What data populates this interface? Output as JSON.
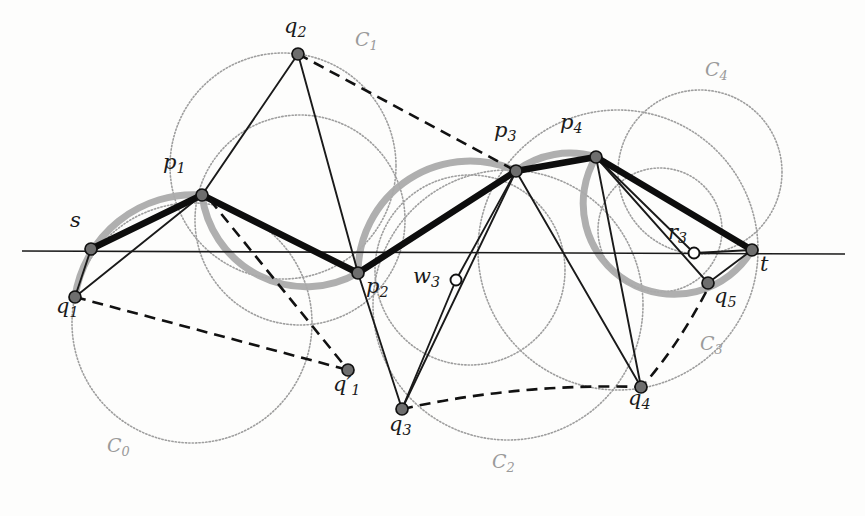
{
  "figure": {
    "background_color": "#fdfdfc",
    "ink_color": "#1a1a1a",
    "circle_color": "#9a9a9a",
    "highlight_color": "#a8a8a8",
    "width": 865,
    "height": 516
  },
  "labels": {
    "s": "s",
    "t": "t",
    "p1": "p",
    "p1_sub": "1",
    "p2": "p",
    "p2_sub": "2",
    "p3": "p",
    "p3_sub": "3",
    "p4": "p",
    "p4_sub": "4",
    "q1": "q",
    "q1_sub": "1",
    "q1p": "q",
    "q1p_sub": "1",
    "q1p_prime": "′",
    "q2": "q",
    "q2_sub": "2",
    "q3": "q",
    "q3_sub": "3",
    "q4": "q",
    "q4_sub": "4",
    "q5": "q",
    "q5_sub": "5",
    "w3": "w",
    "w3_sub": "3",
    "r3": "r",
    "r3_sub": "3",
    "C0": "C",
    "C0_sub": "0",
    "C1": "C",
    "C1_sub": "1",
    "C2": "C",
    "C2_sub": "2",
    "C3": "C",
    "C3_sub": "3",
    "C4": "C",
    "C4_sub": "4"
  },
  "label_positions": {
    "s": {
      "x": 70,
      "y": 222
    },
    "t": {
      "x": 760,
      "y": 252
    },
    "p1": {
      "x": 163,
      "y": 162
    },
    "p2": {
      "x": 366,
      "y": 278
    },
    "p3": {
      "x": 496,
      "y": 130
    },
    "p4": {
      "x": 560,
      "y": 122
    },
    "q1": {
      "x": 56,
      "y": 303
    },
    "q1p": {
      "x": 333,
      "y": 381
    },
    "q2": {
      "x": 284,
      "y": 20
    },
    "q3": {
      "x": 389,
      "y": 418
    },
    "q4": {
      "x": 628,
      "y": 392
    },
    "q5": {
      "x": 714,
      "y": 290
    },
    "w3": {
      "x": 415,
      "y": 265
    },
    "r3": {
      "x": 669,
      "y": 219
    },
    "C0": {
      "x": 107,
      "y": 440
    },
    "C1": {
      "x": 355,
      "y": 32
    },
    "C2": {
      "x": 492,
      "y": 456
    },
    "C3": {
      "x": 700,
      "y": 338
    },
    "C4": {
      "x": 705,
      "y": 64
    }
  },
  "geometry": {
    "baseline": {
      "x1": 22,
      "y1": 251,
      "x2": 845,
      "y2": 254
    },
    "points": {
      "s": {
        "x": 91,
        "y": 249,
        "style": "filled"
      },
      "t": {
        "x": 752,
        "y": 250,
        "style": "filled"
      },
      "p1": {
        "x": 202,
        "y": 195,
        "style": "filled"
      },
      "p2": {
        "x": 358,
        "y": 273,
        "style": "filled"
      },
      "p3": {
        "x": 516,
        "y": 171,
        "style": "filled"
      },
      "p4": {
        "x": 596,
        "y": 157,
        "style": "filled"
      },
      "q1": {
        "x": 75,
        "y": 297,
        "style": "filled"
      },
      "q1p": {
        "x": 348,
        "y": 370,
        "style": "filled"
      },
      "q2": {
        "x": 298,
        "y": 54,
        "style": "filled"
      },
      "q3": {
        "x": 402,
        "y": 409,
        "style": "filled"
      },
      "q4": {
        "x": 641,
        "y": 387,
        "style": "filled"
      },
      "q5": {
        "x": 708,
        "y": 283,
        "style": "filled"
      },
      "w3": {
        "x": 456,
        "y": 280,
        "style": "hollow"
      },
      "r3": {
        "x": 694,
        "y": 253,
        "style": "hollow"
      }
    },
    "circles": [
      {
        "name": "C0",
        "cx": 192,
        "cy": 323,
        "r": 120
      },
      {
        "name": "C1",
        "cx": 283,
        "cy": 166,
        "r": 113
      },
      {
        "name": "C2",
        "cx": 508,
        "cy": 305,
        "r": 135
      },
      {
        "name": "C3",
        "cx": 618,
        "cy": 250,
        "r": 140
      },
      {
        "name": "C4",
        "cx": 700,
        "cy": 172,
        "r": 82
      },
      {
        "name": "extra-left",
        "cx": 300,
        "cy": 220,
        "r": 105
      },
      {
        "name": "extra-mid",
        "cx": 470,
        "cy": 270,
        "r": 95
      },
      {
        "name": "extra-right",
        "cx": 660,
        "cy": 230,
        "r": 62
      }
    ],
    "thick_path": [
      "s",
      "p1",
      "p2",
      "p3",
      "p4",
      "t"
    ],
    "thin_edges": [
      [
        "s",
        "q1"
      ],
      [
        "s",
        "p1"
      ],
      [
        "q1",
        "p1"
      ],
      [
        "p1",
        "q2"
      ],
      [
        "q2",
        "p2"
      ],
      [
        "p2",
        "q3"
      ],
      [
        "q3",
        "w3"
      ],
      [
        "w3",
        "p3"
      ],
      [
        "p3",
        "q3"
      ],
      [
        "p3",
        "w3"
      ],
      [
        "p3",
        "q4"
      ],
      [
        "p4",
        "q4"
      ],
      [
        "p4",
        "r3"
      ],
      [
        "p4",
        "q5"
      ],
      [
        "r3",
        "q5"
      ],
      [
        "q5",
        "t"
      ],
      [
        "r3",
        "t"
      ]
    ],
    "dashed_edges": [
      [
        "q2",
        "p3"
      ],
      [
        "q1",
        "q1p"
      ],
      [
        "p2",
        "q1p"
      ],
      [
        "q3",
        "q4"
      ],
      [
        "q1p",
        "p1"
      ]
    ],
    "highlight_arcs_description": "thick gray arcs along q1-s-p1, p1-p2, p2-p3, p3-p4, p4-t and circle C4"
  }
}
